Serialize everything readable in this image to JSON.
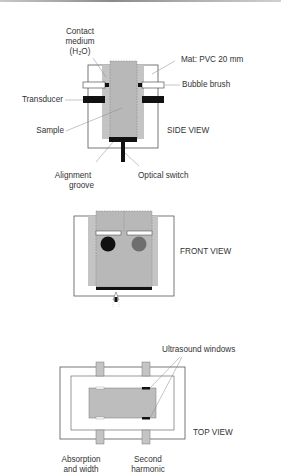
{
  "figure": {
    "colors": {
      "outline": "#555555",
      "medium_fill": "#c4c4c4",
      "sample_fill": "#b8b8b8",
      "black": "#111111",
      "grey_dot": "#6e6e6e",
      "leader": "#888888"
    },
    "side_view": {
      "title": "SIDE VIEW",
      "labels": {
        "contact_medium_line1": "Contact",
        "contact_medium_line2": "medium",
        "contact_medium_line3": "(H₂O)",
        "mat": "Mat: PVC 20 mm",
        "bubble_brush": "Bubble brush",
        "transducer": "Transducer",
        "sample": "Sample",
        "alignment_line1": "Alignment",
        "alignment_line2": "groove",
        "optical_switch": "Optical switch"
      }
    },
    "front_view": {
      "title": "FRONT VIEW"
    },
    "top_view": {
      "title": "TOP VIEW",
      "labels": {
        "ultrasound_windows": "Ultrasound windows",
        "absorption_line1": "Absorption",
        "absorption_line2": "and width",
        "second_line1": "Second",
        "second_line2": "harmonic"
      }
    }
  }
}
